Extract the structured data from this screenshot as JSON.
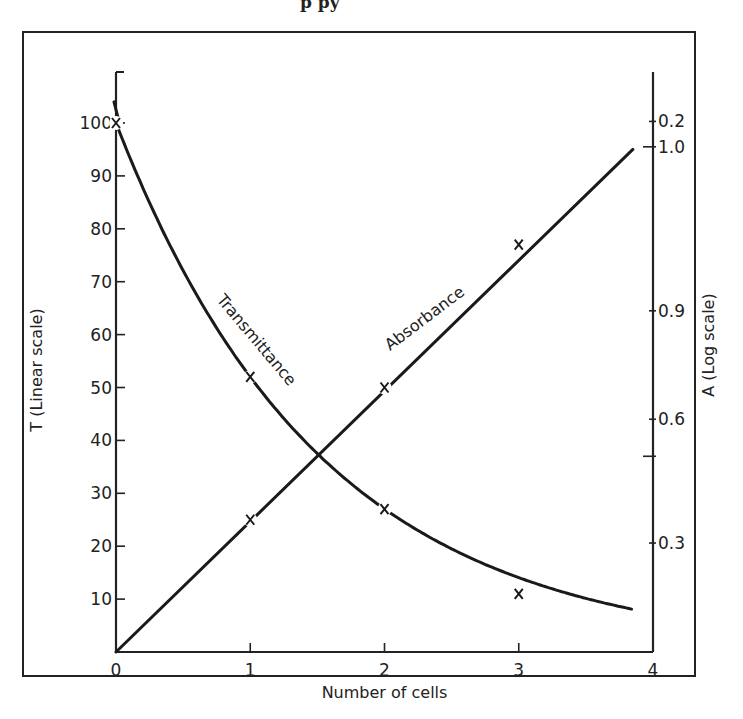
{
  "caption_fragment": "p  py",
  "chart_data": {
    "type": "line",
    "title": "",
    "xlabel": "Number of cells",
    "ylabel_left": "T (Linear scale)",
    "ylabel_right": "A (Log scale)",
    "x_ticks": [
      "0",
      "1",
      "2",
      "3",
      "4"
    ],
    "xlim": [
      0,
      4
    ],
    "y_left_ticks": [
      "10",
      "20",
      "30",
      "40",
      "50",
      "60",
      "70",
      "80",
      "90",
      "100"
    ],
    "ylim_left": [
      0,
      110
    ],
    "y_right_ticks": [
      {
        "label": "0.3",
        "left_equiv": 20.6
      },
      {
        "label": "",
        "left_equiv": 37.0
      },
      {
        "label": "0.6",
        "left_equiv": 44.0
      },
      {
        "label": "0.9",
        "left_equiv": 64.5
      },
      {
        "label": "1.0",
        "left_equiv": 95.5
      },
      {
        "label": "0.2",
        "left_equiv": 100.3
      }
    ],
    "grid": false,
    "legend": "inline labels on curves",
    "series": [
      {
        "name": "Transmittance",
        "axis": "left",
        "x": [
          0,
          1,
          2,
          3
        ],
        "y": [
          100,
          52,
          27,
          11
        ],
        "curve_end": {
          "x": 3.85,
          "y": 6
        },
        "markers": "x"
      },
      {
        "name": "Absorbance",
        "axis": "left-equivalent",
        "x": [
          0,
          1,
          2,
          3
        ],
        "y": [
          0,
          25,
          50,
          77
        ],
        "curve_end": {
          "x": 3.85,
          "y": 95
        },
        "markers": "x"
      }
    ],
    "annotations": [
      {
        "text": "Transmittance",
        "near_x": 0.9,
        "near_y": 60
      },
      {
        "text": "Absorbance",
        "near_x": 2.1,
        "near_y": 58
      }
    ],
    "crossing_point": {
      "x": 1.5,
      "y": 38
    }
  }
}
